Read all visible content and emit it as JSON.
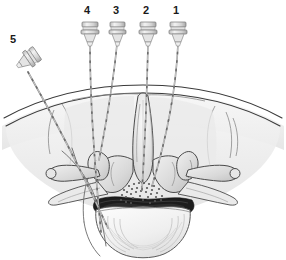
{
  "figure": {
    "background_color": "#ffffff",
    "line_color": "#3a3a3a",
    "label_color": "#1a1a1a"
  },
  "labels": [
    {
      "id": "label-5",
      "text": "5",
      "x": 10,
      "y": 34
    },
    {
      "id": "label-4",
      "text": "4",
      "x": 84,
      "y": 5
    },
    {
      "id": "label-3",
      "text": "3",
      "x": 113,
      "y": 5
    },
    {
      "id": "label-2",
      "text": "2",
      "x": 143,
      "y": 5
    },
    {
      "id": "label-1",
      "text": "1",
      "x": 173,
      "y": 5
    }
  ],
  "needles": [
    {
      "id": "needle-1",
      "number": "1",
      "approach": "transforaminal-right",
      "hub_x": 178,
      "hub_y": 22,
      "tip_x": 152,
      "tip_y": 186,
      "hub_color": "#d8d8d8",
      "shaft_color": "#8c8c8c"
    },
    {
      "id": "needle-2",
      "number": "2",
      "approach": "interlaminar-midline",
      "hub_x": 148,
      "hub_y": 22,
      "tip_x": 142,
      "tip_y": 190,
      "hub_color": "#d8d8d8",
      "shaft_color": "#8c8c8c"
    },
    {
      "id": "needle-3",
      "number": "3",
      "approach": "paramedian-left-shallow",
      "hub_x": 117,
      "hub_y": 22,
      "tip_x": 99,
      "tip_y": 160,
      "hub_color": "#d8d8d8",
      "shaft_color": "#8c8c8c"
    },
    {
      "id": "needle-4",
      "number": "4",
      "approach": "medial-branch-left",
      "hub_x": 90,
      "hub_y": 22,
      "tip_x": 101,
      "tip_y": 232,
      "hub_color": "#d8d8d8",
      "shaft_color": "#8c8c8c"
    },
    {
      "id": "needle-5",
      "number": "5",
      "approach": "oblique-lateral-far",
      "hub_x": 20,
      "hub_y": 58,
      "tip_x": 108,
      "tip_y": 228,
      "hub_color": "#d8d8d8",
      "shaft_color": "#8c8c8c"
    }
  ],
  "anatomy": {
    "skin_line": "curved dermal contour across upper field",
    "muscle_fill": "#ededed",
    "bone_fill": "#e0e0e0",
    "bone_shadow": "#b8b8b8",
    "disc_fill": "#f2f2f2",
    "epidural_fill": "#1c1c1c",
    "stipple_color": "#555555",
    "parts": [
      {
        "name": "skin-surface",
        "label": "Skin"
      },
      {
        "name": "paraspinal-muscle-left",
        "label": "Paraspinal muscle (left)"
      },
      {
        "name": "paraspinal-muscle-right",
        "label": "Paraspinal muscle (right)"
      },
      {
        "name": "spinous-process",
        "label": "Spinous process"
      },
      {
        "name": "lamina-left",
        "label": "Lamina (left)"
      },
      {
        "name": "lamina-right",
        "label": "Lamina (right)"
      },
      {
        "name": "superior-articular-process-left",
        "label": "Superior articular process (left)"
      },
      {
        "name": "superior-articular-process-right",
        "label": "Superior articular process (right)"
      },
      {
        "name": "transverse-process-left",
        "label": "Transverse process (left)"
      },
      {
        "name": "transverse-process-right",
        "label": "Transverse process (right)"
      },
      {
        "name": "epidural-space",
        "label": "Epidural space"
      },
      {
        "name": "dural-sac",
        "label": "Dural sac / thecal sac"
      },
      {
        "name": "vertebral-body",
        "label": "Vertebral body"
      },
      {
        "name": "nerve-root-left",
        "label": "Exiting nerve root (left)"
      }
    ]
  }
}
